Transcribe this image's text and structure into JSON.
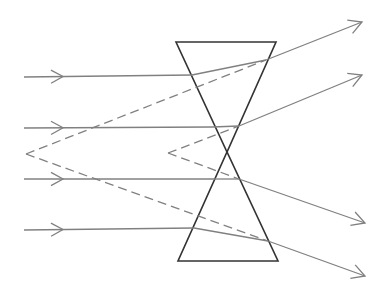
{
  "diagram": {
    "title": "",
    "colors": {
      "background": "#ffffff",
      "ray": "#808080",
      "prism": "#333333"
    },
    "prism": {
      "top_triangle": [
        [
          176,
          42
        ],
        [
          276,
          42
        ],
        [
          227,
          152
        ]
      ],
      "bottom_triangle": [
        [
          178,
          261
        ],
        [
          278,
          261
        ],
        [
          227,
          152
        ]
      ]
    },
    "rays": [
      {
        "id": "ray-1",
        "incoming": [
          [
            24,
            77
          ],
          [
            192,
            75
          ]
        ],
        "inside": [
          [
            192,
            75
          ],
          [
            266,
            60
          ]
        ],
        "outgoing": [
          [
            266,
            60
          ],
          [
            362,
            22
          ]
        ],
        "in_arrow_x": 63,
        "virtual_source": [
          26,
          154
        ]
      },
      {
        "id": "ray-2",
        "incoming": [
          [
            24,
            128
          ],
          [
            212,
            127
          ]
        ],
        "inside": [
          [
            212,
            127
          ],
          [
            239,
            126
          ]
        ],
        "outgoing": [
          [
            239,
            126
          ],
          [
            362,
            75
          ]
        ],
        "in_arrow_x": 63,
        "virtual_source": [
          168,
          153
        ]
      },
      {
        "id": "ray-3",
        "incoming": [
          [
            24,
            179
          ],
          [
            216,
            179
          ]
        ],
        "inside": [
          [
            216,
            179
          ],
          [
            239,
            179
          ]
        ],
        "outgoing": [
          [
            239,
            179
          ],
          [
            365,
            223
          ]
        ],
        "in_arrow_x": 63,
        "virtual_source": [
          168,
          153
        ]
      },
      {
        "id": "ray-4",
        "incoming": [
          [
            24,
            230
          ],
          [
            194,
            228
          ]
        ],
        "inside": [
          [
            194,
            228
          ],
          [
            268,
            241
          ]
        ],
        "outgoing": [
          [
            268,
            241
          ],
          [
            365,
            276
          ]
        ],
        "in_arrow_x": 63,
        "virtual_source": [
          26,
          154
        ]
      }
    ],
    "virtual_focal_points": [
      {
        "id": "outer-focus",
        "x": 26,
        "y": 154
      },
      {
        "id": "inner-focus",
        "x": 168,
        "y": 153
      }
    ]
  }
}
